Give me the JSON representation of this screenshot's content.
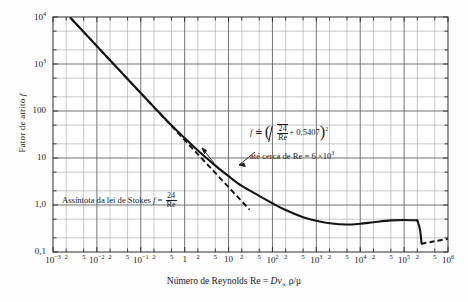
{
  "chart_data": {
    "type": "line",
    "title": "",
    "xlabel": "Número de Reynolds Re = Dv∞ρ/μ",
    "ylabel": "Fator de atrito f",
    "xscale": "log",
    "yscale": "log",
    "xlim": [
      0.001,
      1000000
    ],
    "ylim": [
      0.1,
      10000
    ],
    "grid": true,
    "legend_position": "none",
    "xtick_labels": [
      "10",
      "2",
      "5",
      "10",
      "2",
      "5",
      "10",
      "2",
      "5",
      "1",
      "2",
      "5",
      "10",
      "2",
      "5",
      "10",
      "2",
      "5",
      "10",
      "2",
      "5",
      "10",
      "2",
      "5",
      "10",
      "2",
      "5",
      "10"
    ],
    "xtick_decades": [
      "10⁻³",
      "10⁻²",
      "10⁻¹",
      "1",
      "10",
      "10²",
      "10³",
      "10⁴",
      "10⁵",
      "10⁶"
    ],
    "xtick_minor": [
      "2",
      "5"
    ],
    "ytick_labels": [
      "10⁴",
      "10³",
      "100",
      "10",
      "1,0",
      "0,1"
    ],
    "ytick_values": [
      10000,
      1000,
      100,
      10,
      1.0,
      0.1
    ],
    "series": [
      {
        "name": "Curva experimental do fator de atrito (esfera)",
        "style": "solid",
        "points": [
          [
            0.0025,
            9600
          ],
          [
            0.005,
            4800
          ],
          [
            0.01,
            2400
          ],
          [
            0.02,
            1200
          ],
          [
            0.05,
            480
          ],
          [
            0.1,
            241
          ],
          [
            0.2,
            121
          ],
          [
            0.5,
            49.5
          ],
          [
            1,
            26.5
          ],
          [
            2,
            14.4
          ],
          [
            5,
            6.9
          ],
          [
            10,
            4.1
          ],
          [
            20,
            2.55
          ],
          [
            50,
            1.57
          ],
          [
            100,
            1.09
          ],
          [
            200,
            0.78
          ],
          [
            500,
            0.55
          ],
          [
            1000,
            0.46
          ],
          [
            2000,
            0.41
          ],
          [
            5000,
            0.385
          ],
          [
            10000,
            0.4
          ],
          [
            20000,
            0.43
          ],
          [
            50000,
            0.47
          ],
          [
            100000,
            0.48
          ],
          [
            200000,
            0.47
          ]
        ]
      },
      {
        "name": "Queda abrupta (crise do arrasto)",
        "style": "solid",
        "points": [
          [
            200000,
            0.47
          ],
          [
            230000,
            0.3
          ],
          [
            250000,
            0.15
          ]
        ]
      },
      {
        "name": "Região pós-crise (tracejada)",
        "style": "dashed",
        "points": [
          [
            250000,
            0.15
          ],
          [
            300000,
            0.155
          ],
          [
            500000,
            0.17
          ],
          [
            1000000,
            0.19
          ]
        ]
      },
      {
        "name": "Assíntota da lei de Stokes f = 24/Re",
        "style": "dashed",
        "points": [
          [
            0.0025,
            9600
          ],
          [
            0.1,
            240
          ],
          [
            1,
            24
          ],
          [
            10,
            2.4
          ],
          [
            30,
            0.8
          ]
        ]
      }
    ],
    "annotations": [
      {
        "name": "formula-drag",
        "text": "f ≐ (√(24/Re) + 0,5407)²",
        "parts": {
          "lhs": "f",
          "approx": "≐",
          "num": "24",
          "den": "Re",
          "add": "+ 0,5407",
          "exp": "2"
        }
      },
      {
        "name": "range-note",
        "text": "até cerca de Re = 6 × 10³",
        "parts": {
          "prefix": "até cerca de Re =",
          "coef": "6 ×",
          "base": "10",
          "exp": "3"
        }
      },
      {
        "name": "stokes-asymptote",
        "text": "Assíntota da lei de Stokes f = 24/Re",
        "parts": {
          "prefix": "Assíntota da lei de Stokes",
          "lhs": "f",
          "eq": "=",
          "num": "24",
          "den": "Re"
        }
      }
    ],
    "colors": {
      "curve": "#151515",
      "grid_minor": "#9a9a9a",
      "grid_major": "#5f5f5f",
      "frame": "#444444",
      "background": "#fdfdfd",
      "text": "#1a1a1a"
    }
  },
  "axes": {
    "y_title": "Fator de atrito",
    "y_title_symbol": "f",
    "x_title_prefix": "Número de Reynolds Re =",
    "x_title_symbol": "Dv",
    "x_title_sub": "∞",
    "x_title_rest": "ρ/μ"
  }
}
